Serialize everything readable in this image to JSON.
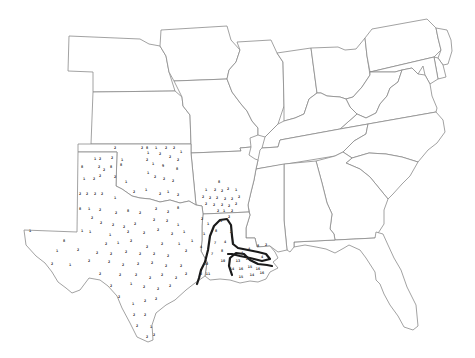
{
  "map": {
    "title": "",
    "style": "black-and-white outline map",
    "region": "Central and Southeastern United States",
    "colors": {
      "background": "#ffffff",
      "state_border": "#8a8a8a",
      "contour": "#1a1a1a",
      "marker_text": "#333333"
    },
    "states": [
      "Nebraska",
      "Iowa",
      "Kansas",
      "Missouri",
      "Illinois",
      "Indiana",
      "Ohio",
      "Pennsylvania",
      "New Jersey",
      "Delaware",
      "Maryland",
      "West Virginia",
      "Virginia",
      "Kentucky",
      "Tennessee",
      "North Carolina",
      "South Carolina",
      "Georgia",
      "Florida",
      "Alabama",
      "Mississippi",
      "Arkansas",
      "Louisiana",
      "Oklahoma",
      "Texas"
    ],
    "marker_regions": [
      "Texas",
      "Oklahoma",
      "Arkansas",
      "Louisiana"
    ],
    "contour_lines": [
      {
        "name": "outer-contour",
        "region": "Louisiana"
      },
      {
        "name": "inner-contour",
        "region": "Louisiana"
      }
    ],
    "markers": [
      {
        "x": 115,
        "y": 149,
        "v": "2"
      },
      {
        "x": 142,
        "y": 149,
        "v": "2"
      },
      {
        "x": 147,
        "y": 149,
        "v": "8"
      },
      {
        "x": 156,
        "y": 149,
        "v": "1"
      },
      {
        "x": 166,
        "y": 149,
        "v": "2"
      },
      {
        "x": 174,
        "y": 149,
        "v": "2"
      },
      {
        "x": 181,
        "y": 153,
        "v": "1"
      },
      {
        "x": 95,
        "y": 160,
        "v": "1"
      },
      {
        "x": 100,
        "y": 160,
        "v": "2"
      },
      {
        "x": 112,
        "y": 159,
        "v": "2"
      },
      {
        "x": 122,
        "y": 161,
        "v": "1"
      },
      {
        "x": 148,
        "y": 154,
        "v": "1"
      },
      {
        "x": 160,
        "y": 155,
        "v": "2"
      },
      {
        "x": 170,
        "y": 158,
        "v": "2"
      },
      {
        "x": 178,
        "y": 161,
        "v": "2"
      },
      {
        "x": 82,
        "y": 168,
        "v": "8"
      },
      {
        "x": 99,
        "y": 168,
        "v": "2"
      },
      {
        "x": 104,
        "y": 171,
        "v": "2"
      },
      {
        "x": 111,
        "y": 168,
        "v": "8"
      },
      {
        "x": 121,
        "y": 166,
        "v": "8"
      },
      {
        "x": 147,
        "y": 161,
        "v": "2"
      },
      {
        "x": 153,
        "y": 165,
        "v": "1"
      },
      {
        "x": 163,
        "y": 167,
        "v": "9"
      },
      {
        "x": 177,
        "y": 170,
        "v": "8"
      },
      {
        "x": 84,
        "y": 180,
        "v": "1"
      },
      {
        "x": 94,
        "y": 180,
        "v": "2"
      },
      {
        "x": 100,
        "y": 177,
        "v": "2"
      },
      {
        "x": 115,
        "y": 178,
        "v": "2"
      },
      {
        "x": 126,
        "y": 183,
        "v": "1"
      },
      {
        "x": 148,
        "y": 174,
        "v": "1"
      },
      {
        "x": 155,
        "y": 178,
        "v": "2"
      },
      {
        "x": 164,
        "y": 180,
        "v": "2"
      },
      {
        "x": 173,
        "y": 182,
        "v": "2"
      },
      {
        "x": 80,
        "y": 195,
        "v": "2"
      },
      {
        "x": 87,
        "y": 195,
        "v": "2"
      },
      {
        "x": 95,
        "y": 195,
        "v": "2"
      },
      {
        "x": 102,
        "y": 195,
        "v": "2"
      },
      {
        "x": 115,
        "y": 199,
        "v": "1"
      },
      {
        "x": 134,
        "y": 193,
        "v": "2"
      },
      {
        "x": 146,
        "y": 191,
        "v": "1"
      },
      {
        "x": 160,
        "y": 195,
        "v": "2"
      },
      {
        "x": 168,
        "y": 193,
        "v": "1"
      },
      {
        "x": 178,
        "y": 196,
        "v": "2"
      },
      {
        "x": 80,
        "y": 210,
        "v": "8"
      },
      {
        "x": 89,
        "y": 210,
        "v": "1"
      },
      {
        "x": 100,
        "y": 211,
        "v": "2"
      },
      {
        "x": 116,
        "y": 214,
        "v": "2"
      },
      {
        "x": 128,
        "y": 212,
        "v": "8"
      },
      {
        "x": 140,
        "y": 214,
        "v": "2"
      },
      {
        "x": 156,
        "y": 210,
        "v": "2"
      },
      {
        "x": 168,
        "y": 213,
        "v": "2"
      },
      {
        "x": 178,
        "y": 209,
        "v": "8"
      },
      {
        "x": 92,
        "y": 219,
        "v": "2"
      },
      {
        "x": 101,
        "y": 224,
        "v": "2"
      },
      {
        "x": 113,
        "y": 226,
        "v": "2"
      },
      {
        "x": 124,
        "y": 228,
        "v": "2"
      },
      {
        "x": 135,
        "y": 225,
        "v": "2"
      },
      {
        "x": 154,
        "y": 221,
        "v": "2"
      },
      {
        "x": 167,
        "y": 222,
        "v": "2"
      },
      {
        "x": 178,
        "y": 226,
        "v": "1"
      },
      {
        "x": 30,
        "y": 232,
        "v": "1"
      },
      {
        "x": 82,
        "y": 232,
        "v": "1"
      },
      {
        "x": 90,
        "y": 233,
        "v": "1"
      },
      {
        "x": 110,
        "y": 236,
        "v": "1"
      },
      {
        "x": 128,
        "y": 233,
        "v": "2"
      },
      {
        "x": 144,
        "y": 234,
        "v": "2"
      },
      {
        "x": 158,
        "y": 231,
        "v": "2"
      },
      {
        "x": 172,
        "y": 235,
        "v": "2"
      },
      {
        "x": 184,
        "y": 233,
        "v": "1"
      },
      {
        "x": 64,
        "y": 242,
        "v": "8"
      },
      {
        "x": 106,
        "y": 245,
        "v": "2"
      },
      {
        "x": 118,
        "y": 244,
        "v": "1"
      },
      {
        "x": 131,
        "y": 242,
        "v": "2"
      },
      {
        "x": 147,
        "y": 248,
        "v": "2"
      },
      {
        "x": 162,
        "y": 245,
        "v": "2"
      },
      {
        "x": 179,
        "y": 245,
        "v": "1"
      },
      {
        "x": 192,
        "y": 242,
        "v": "1"
      },
      {
        "x": 57,
        "y": 252,
        "v": "1"
      },
      {
        "x": 78,
        "y": 251,
        "v": "2"
      },
      {
        "x": 97,
        "y": 254,
        "v": "2"
      },
      {
        "x": 111,
        "y": 255,
        "v": "2"
      },
      {
        "x": 126,
        "y": 253,
        "v": "2"
      },
      {
        "x": 140,
        "y": 255,
        "v": "2"
      },
      {
        "x": 154,
        "y": 255,
        "v": "2"
      },
      {
        "x": 168,
        "y": 257,
        "v": "2"
      },
      {
        "x": 186,
        "y": 252,
        "v": "2"
      },
      {
        "x": 52,
        "y": 265,
        "v": "2"
      },
      {
        "x": 70,
        "y": 266,
        "v": "1"
      },
      {
        "x": 89,
        "y": 262,
        "v": "2"
      },
      {
        "x": 109,
        "y": 263,
        "v": "2"
      },
      {
        "x": 123,
        "y": 266,
        "v": "2"
      },
      {
        "x": 138,
        "y": 265,
        "v": "2"
      },
      {
        "x": 152,
        "y": 264,
        "v": "2"
      },
      {
        "x": 166,
        "y": 267,
        "v": "2"
      },
      {
        "x": 181,
        "y": 267,
        "v": "2"
      },
      {
        "x": 100,
        "y": 275,
        "v": "2"
      },
      {
        "x": 120,
        "y": 276,
        "v": "2"
      },
      {
        "x": 136,
        "y": 276,
        "v": "2"
      },
      {
        "x": 150,
        "y": 279,
        "v": "2"
      },
      {
        "x": 162,
        "y": 276,
        "v": "2"
      },
      {
        "x": 176,
        "y": 279,
        "v": "2"
      },
      {
        "x": 186,
        "y": 275,
        "v": "2"
      },
      {
        "x": 111,
        "y": 287,
        "v": "2"
      },
      {
        "x": 131,
        "y": 285,
        "v": "1"
      },
      {
        "x": 144,
        "y": 288,
        "v": "2"
      },
      {
        "x": 158,
        "y": 290,
        "v": "2"
      },
      {
        "x": 170,
        "y": 287,
        "v": "2"
      },
      {
        "x": 119,
        "y": 298,
        "v": "2"
      },
      {
        "x": 133,
        "y": 305,
        "v": "1"
      },
      {
        "x": 145,
        "y": 302,
        "v": "2"
      },
      {
        "x": 156,
        "y": 300,
        "v": "2"
      },
      {
        "x": 134,
        "y": 316,
        "v": "2"
      },
      {
        "x": 145,
        "y": 316,
        "v": "2"
      },
      {
        "x": 137,
        "y": 327,
        "v": "2"
      },
      {
        "x": 151,
        "y": 328,
        "v": "1"
      },
      {
        "x": 147,
        "y": 338,
        "v": "2"
      },
      {
        "x": 154,
        "y": 336,
        "v": "2"
      },
      {
        "x": 219,
        "y": 183,
        "v": "8"
      },
      {
        "x": 206,
        "y": 191,
        "v": "1"
      },
      {
        "x": 215,
        "y": 191,
        "v": "2"
      },
      {
        "x": 222,
        "y": 192,
        "v": "2"
      },
      {
        "x": 228,
        "y": 190,
        "v": "2"
      },
      {
        "x": 236,
        "y": 191,
        "v": "1"
      },
      {
        "x": 203,
        "y": 198,
        "v": "2"
      },
      {
        "x": 210,
        "y": 199,
        "v": "2"
      },
      {
        "x": 217,
        "y": 199,
        "v": "2"
      },
      {
        "x": 225,
        "y": 200,
        "v": "2"
      },
      {
        "x": 232,
        "y": 200,
        "v": "2"
      },
      {
        "x": 239,
        "y": 198,
        "v": "2"
      },
      {
        "x": 206,
        "y": 205,
        "v": "2"
      },
      {
        "x": 214,
        "y": 206,
        "v": "2"
      },
      {
        "x": 222,
        "y": 206,
        "v": "2"
      },
      {
        "x": 229,
        "y": 207,
        "v": "2"
      },
      {
        "x": 236,
        "y": 205,
        "v": "2"
      },
      {
        "x": 218,
        "y": 212,
        "v": "2"
      },
      {
        "x": 224,
        "y": 212,
        "v": "1"
      },
      {
        "x": 232,
        "y": 212,
        "v": "2"
      },
      {
        "x": 202,
        "y": 220,
        "v": "2"
      },
      {
        "x": 208,
        "y": 225,
        "v": "1"
      },
      {
        "x": 221,
        "y": 222,
        "v": "1"
      },
      {
        "x": 229,
        "y": 218,
        "v": "2"
      },
      {
        "x": 204,
        "y": 235,
        "v": "1"
      },
      {
        "x": 216,
        "y": 232,
        "v": "8"
      },
      {
        "x": 231,
        "y": 233,
        "v": "2"
      },
      {
        "x": 201,
        "y": 248,
        "v": "4"
      },
      {
        "x": 215,
        "y": 244,
        "v": "7"
      },
      {
        "x": 225,
        "y": 243,
        "v": "4"
      },
      {
        "x": 233,
        "y": 245,
        "v": "7"
      },
      {
        "x": 212,
        "y": 255,
        "v": "7"
      },
      {
        "x": 222,
        "y": 252,
        "v": "8"
      },
      {
        "x": 242,
        "y": 254,
        "v": "4"
      },
      {
        "x": 249,
        "y": 250,
        "v": "4"
      },
      {
        "x": 258,
        "y": 247,
        "v": "8"
      },
      {
        "x": 266,
        "y": 246,
        "v": "2"
      },
      {
        "x": 206,
        "y": 265,
        "v": "10"
      },
      {
        "x": 223,
        "y": 262,
        "v": "10"
      },
      {
        "x": 238,
        "y": 262,
        "v": "13"
      },
      {
        "x": 248,
        "y": 260,
        "v": "12"
      },
      {
        "x": 262,
        "y": 258,
        "v": "4"
      },
      {
        "x": 201,
        "y": 275,
        "v": "2"
      },
      {
        "x": 208,
        "y": 275,
        "v": "11"
      },
      {
        "x": 232,
        "y": 270,
        "v": "14"
      },
      {
        "x": 241,
        "y": 270,
        "v": "16"
      },
      {
        "x": 250,
        "y": 268,
        "v": "15"
      },
      {
        "x": 258,
        "y": 270,
        "v": "16"
      },
      {
        "x": 241,
        "y": 278,
        "v": "15"
      },
      {
        "x": 252,
        "y": 276,
        "v": "14"
      },
      {
        "x": 262,
        "y": 274,
        "v": "16"
      }
    ]
  }
}
